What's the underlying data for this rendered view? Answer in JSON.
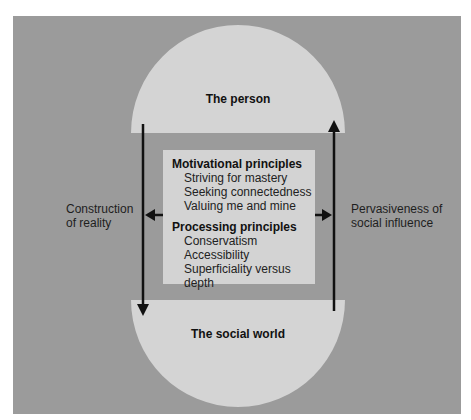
{
  "diagram": {
    "top_node": {
      "label": "The person"
    },
    "bottom_node": {
      "label": "The social world"
    },
    "left_side_label": {
      "line1": "Construction",
      "line2": "of reality"
    },
    "right_side_label": {
      "line1": "Pervasiveness of",
      "line2": "social influence"
    },
    "center_box": {
      "sections": [
        {
          "heading": "Motivational principles",
          "items": [
            "Striving for mastery",
            "Seeking connectedness",
            "Valuing me and mine"
          ]
        },
        {
          "heading": "Processing principles",
          "items": [
            "Conservatism",
            "Accessibility",
            "Superficiality versus depth"
          ]
        }
      ]
    },
    "arrows": [
      {
        "name": "person-to-social-world",
        "direction": "down",
        "side": "left"
      },
      {
        "name": "social-world-to-person",
        "direction": "up",
        "side": "right"
      },
      {
        "name": "center-to-construction-of-reality",
        "direction": "left"
      },
      {
        "name": "center-to-pervasiveness",
        "direction": "right"
      }
    ],
    "colors": {
      "background": "#ffffff",
      "frame": "#9b9b9b",
      "node_fill": "#d4d4d4",
      "center_box_fill": "#d3d3d3",
      "arrow": "#111111"
    }
  }
}
